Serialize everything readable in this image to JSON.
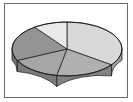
{
  "figure": {
    "title": "",
    "background_color": "#ffffff",
    "frame_color": "#6b6b6b",
    "outline_color": "#1d1d1d"
  },
  "chart_data": {
    "type": "pie",
    "title": "",
    "subtitle": "",
    "xlabel": "",
    "ylabel": "",
    "grid": false,
    "legend": "none",
    "three_d": true,
    "start_angle_deg": 90,
    "direction": "clockwise",
    "center": {
      "x": 67,
      "y": 49
    },
    "radius_x": 55,
    "radius_y": 27,
    "depth": 11,
    "labels": [
      "Slice 1",
      "Slice 2",
      "Slice 3",
      "Slice 4",
      "Slice 5"
    ],
    "values": [
      35,
      18,
      15,
      22,
      10
    ],
    "percentages": [
      "35%",
      "18%",
      "15%",
      "22%",
      "10%"
    ],
    "colors": [
      "#d9d9d9",
      "#b0b0b0",
      "#a6a6a6",
      "#949494",
      "#e9e9e9"
    ],
    "wall_colors": [
      "#9e9e9e",
      "#828282",
      "#7a7a7a",
      "#6e6e6e",
      "#adadad"
    ],
    "slices": [
      {
        "label": "Slice 1",
        "value": 35,
        "percent": "35%",
        "color": "#d9d9d9",
        "wall_color": "#9e9e9e",
        "start_deg": 90,
        "end_deg": -36
      },
      {
        "label": "Slice 2",
        "value": 18,
        "percent": "18%",
        "color": "#b0b0b0",
        "wall_color": "#828282",
        "start_deg": -36,
        "end_deg": -100.8
      },
      {
        "label": "Slice 3",
        "value": 15,
        "percent": "15%",
        "color": "#a6a6a6",
        "wall_color": "#7a7a7a",
        "start_deg": -100.8,
        "end_deg": -154.8
      },
      {
        "label": "Slice 4",
        "value": 22,
        "percent": "22%",
        "color": "#949494",
        "wall_color": "#6e6e6e",
        "start_deg": -154.8,
        "end_deg": -234
      },
      {
        "label": "Slice 5",
        "value": 10,
        "percent": "10%",
        "color": "#e9e9e9",
        "wall_color": "#adadad",
        "start_deg": -234,
        "end_deg": -270
      }
    ]
  }
}
